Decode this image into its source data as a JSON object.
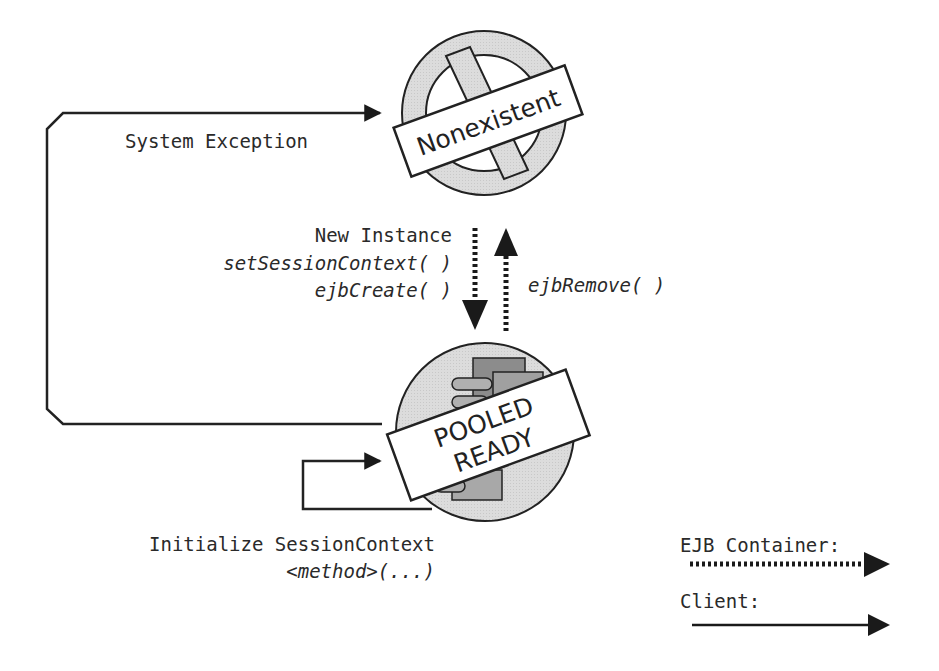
{
  "diagram": {
    "states": {
      "nonexistent": {
        "label": "Nonexistent"
      },
      "pooled_ready": {
        "line1": "POOLED",
        "line2": "READY"
      }
    },
    "transitions": {
      "system_exception": {
        "label": "System Exception",
        "kind": "client"
      },
      "create": {
        "lines": [
          "New Instance",
          "setSessionContext( )",
          "ejbCreate( )"
        ],
        "kind": "container"
      },
      "remove": {
        "label": "ejbRemove( )",
        "kind": "container"
      },
      "self_loop": {
        "lines": [
          "Initialize SessionContext",
          "<method>(...)"
        ],
        "kind": "client"
      }
    },
    "legend": {
      "container": {
        "label": "EJB Container:",
        "style": "dotted"
      },
      "client": {
        "label": "Client:",
        "style": "solid"
      }
    },
    "colors": {
      "ring_fill": "#d9d9d9",
      "card_dark": "#8c8c8c",
      "card_mid": "#a8a8a8",
      "stroke": "#222222",
      "text": "#2a2a2a"
    }
  }
}
